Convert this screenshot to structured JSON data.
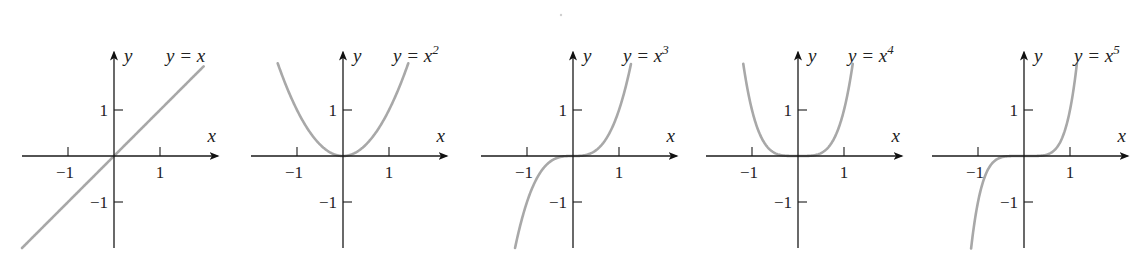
{
  "figure": {
    "stray_mark": "·"
  },
  "chart_data": [
    {
      "type": "line",
      "title": "y = x",
      "label": {
        "base": "y = x",
        "exponent": ""
      },
      "function_power": 1,
      "xlabel": "x",
      "ylabel": "y",
      "xticks": [
        -1,
        1
      ],
      "yticks": [
        1,
        -1
      ],
      "xtick_labels": [
        "−1",
        "1"
      ],
      "ytick_labels": [
        "1",
        "−1"
      ],
      "xlim": [
        -2.0,
        2.25
      ],
      "ylim": [
        -2.0,
        2.25
      ],
      "domain": [
        -2.0,
        1.95
      ],
      "grid": false,
      "origin_px": [
        114,
        156
      ],
      "unit_px": 46
    },
    {
      "type": "line",
      "title": "y = x^2",
      "label": {
        "base": "y = x",
        "exponent": "2"
      },
      "function_power": 2,
      "xlabel": "x",
      "ylabel": "y",
      "xticks": [
        -1,
        1
      ],
      "yticks": [
        1,
        -1
      ],
      "xtick_labels": [
        "−1",
        "1"
      ],
      "ytick_labels": [
        "1",
        "−1"
      ],
      "xlim": [
        -2.0,
        2.25
      ],
      "ylim": [
        -2.0,
        2.25
      ],
      "domain": [
        -1.42,
        1.42
      ],
      "grid": false,
      "origin_px": [
        343,
        156
      ],
      "unit_px": 46
    },
    {
      "type": "line",
      "title": "y = x^3",
      "label": {
        "base": "y = x",
        "exponent": "3"
      },
      "function_power": 3,
      "xlabel": "x",
      "ylabel": "y",
      "xticks": [
        -1,
        1
      ],
      "yticks": [
        1,
        -1
      ],
      "xtick_labels": [
        "−1",
        "1"
      ],
      "ytick_labels": [
        "1",
        "−1"
      ],
      "xlim": [
        -2.0,
        2.25
      ],
      "ylim": [
        -2.0,
        2.25
      ],
      "domain": [
        -1.26,
        1.26
      ],
      "grid": false,
      "origin_px": [
        573,
        156
      ],
      "unit_px": 46
    },
    {
      "type": "line",
      "title": "y = x^4",
      "label": {
        "base": "y = x",
        "exponent": "4"
      },
      "function_power": 4,
      "xlabel": "x",
      "ylabel": "y",
      "xticks": [
        -1,
        1
      ],
      "yticks": [
        1,
        -1
      ],
      "xtick_labels": [
        "−1",
        "1"
      ],
      "ytick_labels": [
        "1",
        "−1"
      ],
      "xlim": [
        -2.0,
        2.25
      ],
      "ylim": [
        -2.0,
        2.25
      ],
      "domain": [
        -1.19,
        1.19
      ],
      "grid": false,
      "origin_px": [
        798,
        156
      ],
      "unit_px": 46
    },
    {
      "type": "line",
      "title": "y = x^5",
      "label": {
        "base": "y = x",
        "exponent": "5"
      },
      "function_power": 5,
      "xlabel": "x",
      "ylabel": "y",
      "xticks": [
        -1,
        1
      ],
      "yticks": [
        1,
        -1
      ],
      "xtick_labels": [
        "−1",
        "1"
      ],
      "ytick_labels": [
        "1",
        "−1"
      ],
      "xlim": [
        -2.0,
        2.25
      ],
      "ylim": [
        -2.0,
        2.25
      ],
      "domain": [
        -1.15,
        1.15
      ],
      "grid": false,
      "origin_px": [
        1024,
        156
      ],
      "unit_px": 46
    }
  ]
}
